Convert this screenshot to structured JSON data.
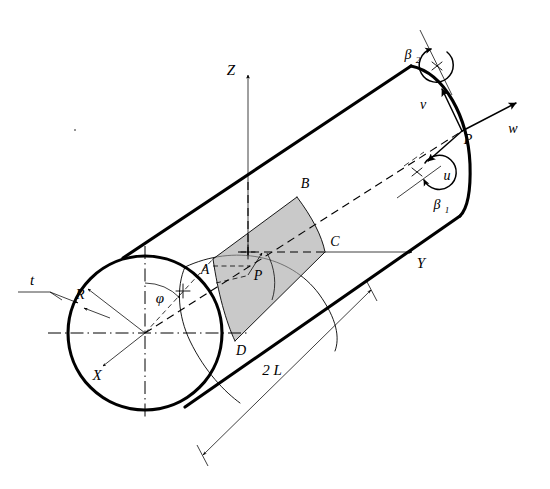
{
  "figure": {
    "background_color": "#ffffff",
    "line_color": "#000000",
    "panel_fill_color": "#a8a8a8"
  },
  "axes": [
    {
      "id": "z",
      "label": "Z",
      "direction": "up",
      "label_x": 231,
      "label_y": 70
    },
    {
      "id": "y",
      "label": "Y",
      "direction": "right",
      "label_x": 421,
      "label_y": 264
    },
    {
      "id": "x",
      "label": "X",
      "direction": "down-left",
      "label_x": 97,
      "label_y": 377
    }
  ],
  "geometry_labels": [
    {
      "id": "radius",
      "label": "R",
      "label_x": 80,
      "label_y": 299,
      "meaning": "cylinder radius"
    },
    {
      "id": "thickness",
      "label": "t",
      "label_x": 32,
      "label_y": 283,
      "meaning": "shell wall thickness"
    },
    {
      "id": "angle",
      "label": "φ",
      "label_x": 160,
      "label_y": 302,
      "meaning": "circumferential angle phi"
    },
    {
      "id": "length",
      "label": "2 L",
      "label_x": 272,
      "label_y": 370,
      "meaning": "total cylinder length"
    }
  ],
  "panel_points": [
    {
      "id": "A",
      "label": "A",
      "label_x": 207,
      "label_y": 271,
      "x": 213,
      "y": 259
    },
    {
      "id": "B",
      "label": "B",
      "label_x": 303,
      "label_y": 186,
      "x": 297,
      "y": 197
    },
    {
      "id": "C",
      "label": "C",
      "label_x": 332,
      "label_y": 243,
      "x": 325,
      "y": 252
    },
    {
      "id": "D",
      "label": "D",
      "label_x": 240,
      "label_y": 352,
      "x": 235,
      "y": 341
    },
    {
      "id": "P_panel",
      "label": "P",
      "label_x": 262,
      "label_y": 273,
      "x": 258,
      "y": 255
    }
  ],
  "local_frame": {
    "origin_label": "P",
    "origin_label_x": 466,
    "origin_label_y": 139,
    "origin_x": 462,
    "origin_y": 131,
    "vectors": [
      {
        "id": "u",
        "label": "u",
        "meaning": "axial displacement",
        "label_x": 447,
        "label_y": 176
      },
      {
        "id": "v",
        "label": "v",
        "meaning": "circumferential displacement",
        "label_x": 424,
        "label_y": 105
      },
      {
        "id": "w",
        "label": "w",
        "meaning": "radial displacement",
        "label_x": 512,
        "label_y": 129
      }
    ],
    "rotations": [
      {
        "id": "beta1",
        "label": "β",
        "subscript": "1",
        "meaning": "rotation about axial direction",
        "label_x": 441,
        "label_y": 205
      },
      {
        "id": "beta2",
        "label": "β",
        "subscript": "2",
        "meaning": "rotation about circumferential direction",
        "label_x": 410,
        "label_y": 55
      }
    ]
  }
}
